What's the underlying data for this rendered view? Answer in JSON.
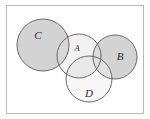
{
  "figure": {
    "type": "venn-diagram",
    "title": "",
    "frame": {
      "border_color": "#b9b9b9",
      "background": "#ffffff"
    },
    "palette": {
      "shaded_fill": "#d3d3d3",
      "light_fill": "#efefef",
      "unshaded_fill": "#ffffff",
      "stroke": "#555555"
    },
    "sets": [
      {
        "id": "C",
        "label": "C",
        "label_x": 38,
        "label_y": 36,
        "cx": 43,
        "cy": 45,
        "r": 26,
        "shaded": true,
        "fill": "#d3d3d3"
      },
      {
        "id": "A",
        "label": "A",
        "label_x": 77,
        "label_y": 49,
        "cx": 79,
        "cy": 56,
        "r": 22,
        "shaded": false,
        "fill": "#ffffff"
      },
      {
        "id": "B",
        "label": "B",
        "label_x": 120,
        "label_y": 57,
        "cx": 115,
        "cy": 57,
        "r": 22,
        "shaded": true,
        "fill": "#d3d3d3"
      },
      {
        "id": "D",
        "label": "D",
        "label_x": 89,
        "label_y": 94,
        "cx": 89,
        "cy": 79,
        "r": 23,
        "shaded": false,
        "fill": "#ffffff"
      }
    ]
  }
}
